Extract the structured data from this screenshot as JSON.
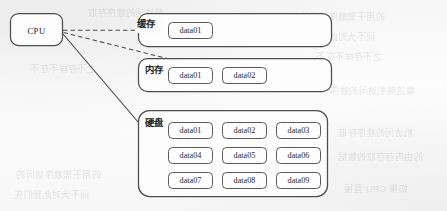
{
  "figure": {
    "kind": "memory-hierarchy-diagram",
    "cpu": {
      "label": "CPU"
    },
    "containers": [
      {
        "id": "cache",
        "label": "缓存",
        "label_role": "cache",
        "chips": [
          "data01"
        ]
      },
      {
        "id": "memory",
        "label": "内存",
        "label_role": "main-memory",
        "chips": [
          "data01",
          "data02"
        ]
      },
      {
        "id": "disk",
        "label": "硬盘",
        "label_role": "disk",
        "chips": [
          [
            "data01",
            "data02",
            "data03"
          ],
          [
            "data04",
            "data05",
            "data06"
          ],
          [
            "data07",
            "data08",
            "data09"
          ]
        ]
      }
    ],
    "connectors": [
      {
        "id": "cpu-to-cache",
        "from": "cpu",
        "to": "cache.data01",
        "style": "dashed",
        "arrow": "end"
      },
      {
        "id": "cpu-to-memory",
        "from": "cpu",
        "to": "memory.data02",
        "style": "dashed",
        "arrow": "end"
      },
      {
        "id": "cpu-to-disk",
        "from": "cpu",
        "to": "disk.data04",
        "style": "solid",
        "arrow": "end"
      }
    ],
    "colors": {
      "page_background": "#fbfbfb",
      "outline": "#4d4d4d",
      "chip_outline": "#5a5a5a",
      "text": "#2b2b2b",
      "connector": "#4a4a4a"
    }
  },
  "bleed_through": {
    "note": "faint mirrored text showing through from the reverse page",
    "lines": [
      "的用于需顺序访问的",
      "间不大对此我们先",
      "之不存样不在不",
      "章这随机访问的顺序",
      "机访问的顺序存取",
      "的由内存存取的数据",
      "如果 CPU 直接"
    ]
  }
}
